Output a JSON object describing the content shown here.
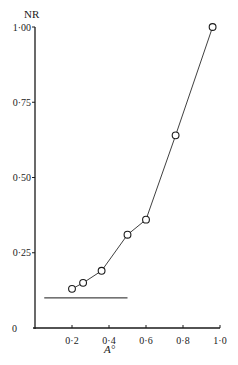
{
  "chart_data": {
    "type": "line",
    "title": "",
    "xlabel": "A°",
    "ylabel": "NR",
    "xlim": [
      0,
      1.0
    ],
    "ylim": [
      0,
      1.0
    ],
    "x_ticks": [
      "0·2",
      "0·4",
      "0·6",
      "0·8",
      "1·0"
    ],
    "x_tick_values": [
      0.2,
      0.4,
      0.6,
      0.8,
      1.0
    ],
    "y_ticks": [
      "0",
      "0·25",
      "0·50",
      "0·75",
      "1·00"
    ],
    "y_tick_values": [
      0,
      0.25,
      0.5,
      0.75,
      1.0
    ],
    "grid": false,
    "legend": null,
    "series": [
      {
        "name": "NR vs A°",
        "marker": "open-circle",
        "x": [
          0.2,
          0.26,
          0.36,
          0.5,
          0.6,
          0.76,
          0.96
        ],
        "y": [
          0.13,
          0.15,
          0.19,
          0.31,
          0.36,
          0.64,
          1.0
        ]
      }
    ],
    "annotations": [
      {
        "type": "horizontal-line",
        "y": 0.1,
        "x_start": 0.05,
        "x_end": 0.5
      }
    ]
  },
  "axes": {
    "y_title": "NR",
    "x_title": "A°"
  }
}
